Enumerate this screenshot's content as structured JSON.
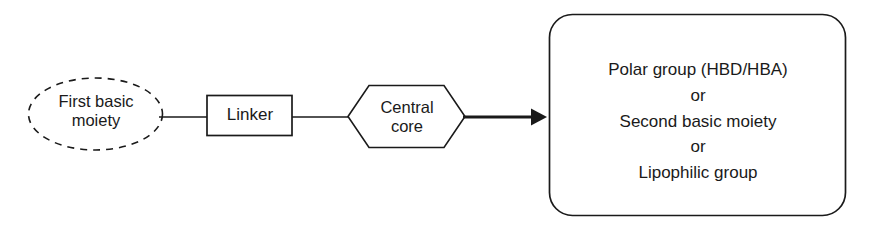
{
  "diagram": {
    "type": "pharmacophore-schematic-flow",
    "orientation": "left-to-right",
    "background_color": "#ffffff",
    "stroke_color": "#1a1a1a",
    "nodes": [
      {
        "id": "first-basic-moiety",
        "shape": "ellipse",
        "border_style": "dashed",
        "lines": [
          "First basic",
          "moiety"
        ]
      },
      {
        "id": "linker",
        "shape": "rectangle",
        "border_style": "solid",
        "lines": [
          "Linker"
        ]
      },
      {
        "id": "central-core",
        "shape": "hexagon",
        "border_style": "solid",
        "lines": [
          "Central",
          "core"
        ]
      },
      {
        "id": "terminal-options",
        "shape": "rounded-rectangle",
        "border_style": "solid",
        "lines": [
          "Polar group (HBD/HBA)",
          "or",
          "Second basic moiety",
          "or",
          "Lipophilic group"
        ]
      }
    ],
    "connectors": [
      {
        "id": "moiety-to-linker",
        "from": "first-basic-moiety",
        "to": "linker",
        "style": "plain-line"
      },
      {
        "id": "linker-to-core",
        "from": "linker",
        "to": "central-core",
        "style": "plain-line"
      },
      {
        "id": "core-to-terminal",
        "from": "central-core",
        "to": "terminal-options",
        "style": "filled-arrow"
      }
    ]
  }
}
